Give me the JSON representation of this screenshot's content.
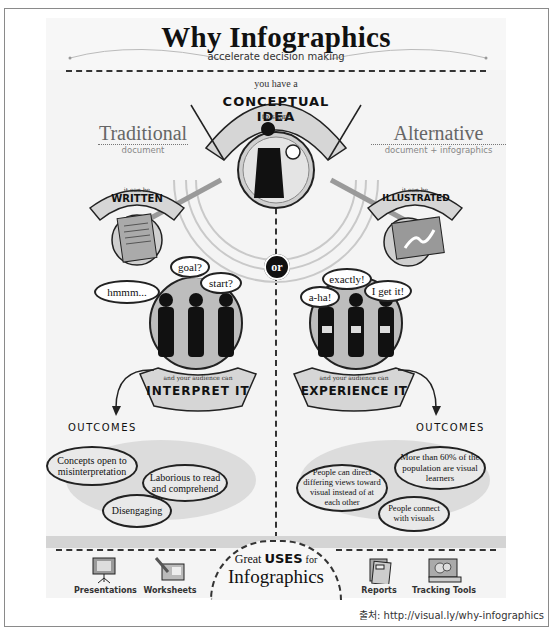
{
  "header": {
    "title": "Why Infographics",
    "subtitle": "accelerate decision making"
  },
  "center": {
    "top_small": "you have a",
    "top_big": "CONCEPTUAL IDEA",
    "top_tail": "to share",
    "figure_icon": "person-with-lightbulb-icon",
    "or_label": "or"
  },
  "left": {
    "heading": "Traditional",
    "subheading": "document",
    "banner_small": "it can be",
    "banner_big": "WRITTEN",
    "doc_icon": "document-pages-icon",
    "bubbles": [
      "hmmm...",
      "goal?",
      "start?"
    ],
    "audience_small": "and your audience can",
    "audience_big": "INTERPRET IT",
    "outcomes_label": "OUTCOMES",
    "outcomes": [
      "Concepts open to misinterpretation",
      "Laborious to read and comprehend",
      "Disengaging"
    ]
  },
  "right": {
    "heading": "Alternative",
    "subheading": "document + infographics",
    "banner_small": "it can be",
    "banner_big": "ILLUSTRATED",
    "doc_icon": "illustrated-page-icon",
    "bubbles": [
      "a-ha!",
      "exactly!",
      "I get it!"
    ],
    "audience_small": "and your audience can",
    "audience_big": "EXPERIENCE IT",
    "outcomes_label": "OUTCOMES",
    "outcomes": [
      "More than 60% of the population are visual learners",
      "People can direct differing views toward visual instead of at each other",
      "People connect with visuals"
    ]
  },
  "footer": {
    "center_line1_a": "Great",
    "center_line1_b": "USES",
    "center_line1_c": "for",
    "center_line2": "Infographics",
    "uses": [
      {
        "label": "Presentations",
        "icon": "presentation-easel-icon"
      },
      {
        "label": "Worksheets",
        "icon": "worksheet-pencil-icon"
      },
      {
        "label": "Reports",
        "icon": "report-book-icon"
      },
      {
        "label": "Tracking Tools",
        "icon": "tracking-chart-icon"
      }
    ]
  },
  "source": {
    "text": "출처: http://visual.ly/why-infographics"
  },
  "colors": {
    "ink": "#111111",
    "poster_bg": "#f4f4f4",
    "mid_gray": "#9a9a9a",
    "light_gray": "#d9d9d9",
    "frame": "#8a8a8a"
  }
}
